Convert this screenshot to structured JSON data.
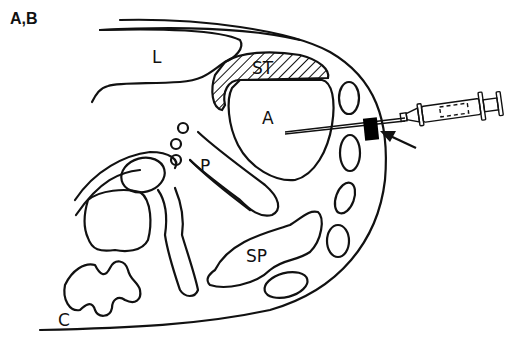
{
  "figure": {
    "panel_label": "A,B",
    "labels": {
      "liver": "L",
      "stomach": "ST",
      "abscess": "A",
      "pancreas": "P",
      "spleen": "SP",
      "colon": "C"
    },
    "colors": {
      "line": "#111111",
      "background": "#ffffff",
      "marker": "#000000"
    }
  }
}
